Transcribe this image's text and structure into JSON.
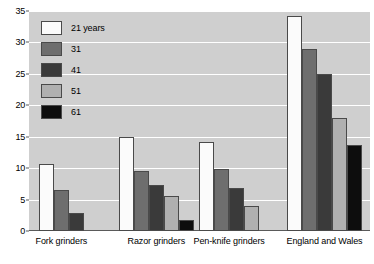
{
  "chart_data": {
    "type": "bar",
    "title": "",
    "subtitle": "",
    "xlabel": "",
    "ylabel": "",
    "ylim": [
      0,
      35
    ],
    "ytick_step": 5,
    "yticks": [
      "0",
      "5",
      "10",
      "15",
      "20",
      "25",
      "30",
      "35"
    ],
    "grid": true,
    "legend_position": "top-left-inside",
    "categories": [
      "Fork grinders",
      "Razor grinders",
      "Pen-knife grinders",
      "England and Wales"
    ],
    "series": [
      {
        "name": "21 years",
        "color": "#fbfbfb",
        "values": [
          10.7,
          15.0,
          14.2,
          34.2
        ]
      },
      {
        "name": "31",
        "color": "#6e6e6e",
        "values": [
          6.6,
          9.6,
          9.8,
          29.0
        ]
      },
      {
        "name": "41",
        "color": "#3a3a3a",
        "values": [
          2.9,
          7.3,
          6.9,
          25.0
        ]
      },
      {
        "name": "51",
        "color": "#b0b0b0",
        "values": [
          null,
          5.6,
          4.0,
          18.0
        ]
      },
      {
        "name": "61",
        "color": "#0d0d0d",
        "values": [
          null,
          1.8,
          null,
          13.7
        ]
      }
    ],
    "plot_background": "#cfcfcf",
    "gridline_color": "#ffffff",
    "axis_color": "#5a5a5a"
  }
}
